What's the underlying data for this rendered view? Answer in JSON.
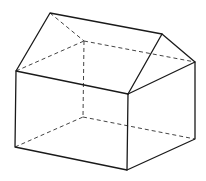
{
  "figure": {
    "stroke_color": "#1a1a1a",
    "hidden_color": "#444444",
    "vertices": {
      "roof_front": [
        50,
        13
      ],
      "roof_back": [
        162,
        34
      ],
      "left_top_front": [
        16,
        71
      ],
      "left_bottom_front": [
        15,
        147
      ],
      "front_top": [
        128,
        94
      ],
      "front_bottom": [
        127,
        170
      ],
      "right_top": [
        195,
        62
      ],
      "right_bottom": [
        195,
        139
      ],
      "hidden_top": [
        84,
        41
      ],
      "hidden_bottom": [
        83,
        117
      ]
    }
  }
}
